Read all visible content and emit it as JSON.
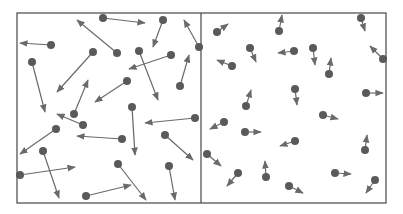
{
  "diagram": {
    "colors": {
      "background": "#ffffff",
      "frame": "#555555",
      "particle": "#5a5a5a",
      "arrow": "#6a6a6a"
    },
    "frame": {
      "x": 17,
      "y": 13,
      "width": 369,
      "height": 190,
      "divider_x": 201
    },
    "particle_radius": 4,
    "panels": [
      {
        "id": "left-box",
        "label": "high-speed particles",
        "particles": [
          {
            "x": 103,
            "y": 18,
            "ax": 145,
            "ay": 23
          },
          {
            "x": 163,
            "y": 20,
            "ax": 153,
            "ay": 47
          },
          {
            "x": 51,
            "y": 45,
            "ax": 20,
            "ay": 43
          },
          {
            "x": 117,
            "y": 53,
            "ax": 77,
            "ay": 20
          },
          {
            "x": 93,
            "y": 52,
            "ax": 57,
            "ay": 92
          },
          {
            "x": 139,
            "y": 51,
            "ax": 158,
            "ay": 100
          },
          {
            "x": 171,
            "y": 55,
            "ax": 129,
            "ay": 69
          },
          {
            "x": 199,
            "y": 47,
            "ax": 184,
            "ay": 20
          },
          {
            "x": 32,
            "y": 62,
            "ax": 45,
            "ay": 112
          },
          {
            "x": 127,
            "y": 81,
            "ax": 95,
            "ay": 102
          },
          {
            "x": 180,
            "y": 86,
            "ax": 189,
            "ay": 55
          },
          {
            "x": 74,
            "y": 114,
            "ax": 88,
            "ay": 80
          },
          {
            "x": 132,
            "y": 107,
            "ax": 135,
            "ay": 155
          },
          {
            "x": 83,
            "y": 125,
            "ax": 57,
            "ay": 114
          },
          {
            "x": 56,
            "y": 129,
            "ax": 20,
            "ay": 154
          },
          {
            "x": 122,
            "y": 139,
            "ax": 77,
            "ay": 136
          },
          {
            "x": 195,
            "y": 118,
            "ax": 145,
            "ay": 123
          },
          {
            "x": 165,
            "y": 135,
            "ax": 193,
            "ay": 160
          },
          {
            "x": 43,
            "y": 151,
            "ax": 59,
            "ay": 198
          },
          {
            "x": 20,
            "y": 175,
            "ax": 75,
            "ay": 167
          },
          {
            "x": 118,
            "y": 164,
            "ax": 146,
            "ay": 200
          },
          {
            "x": 169,
            "y": 166,
            "ax": 175,
            "ay": 200
          },
          {
            "x": 86,
            "y": 196,
            "ax": 131,
            "ay": 185
          }
        ]
      },
      {
        "id": "right-box",
        "label": "low-speed particles",
        "particles": [
          {
            "x": 217,
            "y": 32,
            "ax": 228,
            "ay": 24
          },
          {
            "x": 279,
            "y": 31,
            "ax": 282,
            "ay": 15
          },
          {
            "x": 361,
            "y": 18,
            "ax": 365,
            "ay": 31
          },
          {
            "x": 250,
            "y": 48,
            "ax": 256,
            "ay": 62
          },
          {
            "x": 294,
            "y": 51,
            "ax": 278,
            "ay": 53
          },
          {
            "x": 313,
            "y": 48,
            "ax": 315,
            "ay": 65
          },
          {
            "x": 232,
            "y": 66,
            "ax": 217,
            "ay": 60
          },
          {
            "x": 383,
            "y": 59,
            "ax": 370,
            "ay": 46
          },
          {
            "x": 329,
            "y": 74,
            "ax": 331,
            "ay": 58
          },
          {
            "x": 295,
            "y": 89,
            "ax": 297,
            "ay": 105
          },
          {
            "x": 246,
            "y": 106,
            "ax": 251,
            "ay": 90
          },
          {
            "x": 366,
            "y": 93,
            "ax": 383,
            "ay": 93
          },
          {
            "x": 323,
            "y": 115,
            "ax": 338,
            "ay": 119
          },
          {
            "x": 224,
            "y": 122,
            "ax": 210,
            "ay": 129
          },
          {
            "x": 245,
            "y": 132,
            "ax": 261,
            "ay": 132
          },
          {
            "x": 295,
            "y": 141,
            "ax": 280,
            "ay": 146
          },
          {
            "x": 365,
            "y": 150,
            "ax": 367,
            "ay": 135
          },
          {
            "x": 207,
            "y": 154,
            "ax": 221,
            "ay": 166
          },
          {
            "x": 238,
            "y": 173,
            "ax": 227,
            "ay": 186
          },
          {
            "x": 266,
            "y": 177,
            "ax": 265,
            "ay": 161
          },
          {
            "x": 335,
            "y": 173,
            "ax": 351,
            "ay": 174
          },
          {
            "x": 375,
            "y": 180,
            "ax": 366,
            "ay": 193
          },
          {
            "x": 289,
            "y": 186,
            "ax": 303,
            "ay": 193
          }
        ]
      }
    ]
  }
}
